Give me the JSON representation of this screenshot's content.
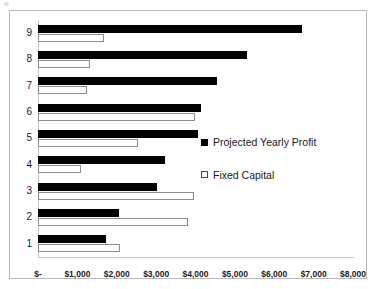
{
  "chart_data": {
    "type": "bar",
    "orientation": "horizontal",
    "title": "",
    "xlabel": "",
    "ylabel": "",
    "categories": [
      "1",
      "2",
      "3",
      "4",
      "5",
      "6",
      "7",
      "8",
      "9"
    ],
    "series": [
      {
        "name": "Projected Yearly Profit",
        "swatch": "filled",
        "color": "#000000",
        "values": [
          1730,
          2060,
          3020,
          3230,
          4060,
          4140,
          4550,
          5300,
          6700
        ]
      },
      {
        "name": "Fixed Capital",
        "swatch": "hollow",
        "color": "#ffffff",
        "values": [
          2080,
          3810,
          3960,
          1090,
          2540,
          3990,
          1240,
          1320,
          1680
        ]
      }
    ],
    "xlim": [
      0,
      8000
    ],
    "xticks": [
      0,
      1000,
      2000,
      3000,
      4000,
      5000,
      6000,
      7000,
      8000
    ],
    "xtick_labels": [
      "$-",
      "$1,000",
      "$2,000",
      "$3,000",
      "$4,000",
      "$5,000",
      "$6,000",
      "$7,000",
      "$8,000"
    ],
    "grid": false,
    "legend_position": "center-right"
  },
  "legend": {
    "items": [
      {
        "label": "Projected Yearly Profit",
        "swatch": "filled"
      },
      {
        "label": "Fixed Capital",
        "swatch": "hollow"
      }
    ]
  },
  "colors": {
    "profit": "#000000",
    "capital": "#ffffff",
    "axis": "#c9c9c9",
    "frame": "#b9b9b9",
    "text": "#1a1a1a"
  }
}
